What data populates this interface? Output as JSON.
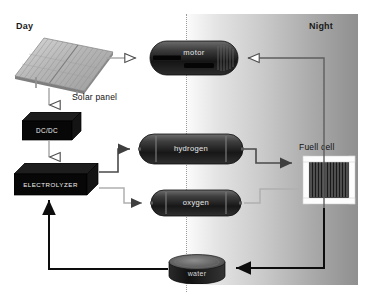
{
  "diagram": {
    "title_left": "Day",
    "title_right": "Night",
    "labels": {
      "solar_panel": "Solar panel",
      "fuel_cell": "Fuell cell"
    },
    "components": {
      "dcdc": "DC/DC",
      "electrolyzer": "ELECTROLYZER",
      "motor": "motor",
      "hydrogen": "hydrogen",
      "oxygen": "oxygen",
      "water": "water"
    },
    "colors": {
      "box_black": "#060606",
      "tank_dark": "#2b2b2b",
      "wire_gray": "#9a9a9a",
      "wire_black": "#111111",
      "night_gradient_start": "#fbfbfb",
      "night_gradient_end": "#8f8f8f",
      "label_text": "#1a1a1a"
    }
  }
}
